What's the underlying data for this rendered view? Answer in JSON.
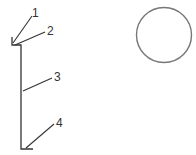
{
  "diagram": {
    "labels": [
      {
        "id": "1",
        "text": "1"
      },
      {
        "id": "2",
        "text": "2"
      },
      {
        "id": "3",
        "text": "3"
      },
      {
        "id": "4",
        "text": "4"
      }
    ],
    "colors": {
      "stroke": "#333333",
      "circle": "#777777",
      "background": "#ffffff"
    }
  }
}
